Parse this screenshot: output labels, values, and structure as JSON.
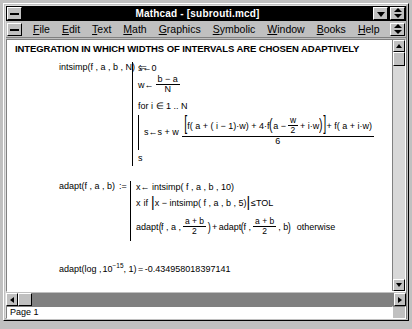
{
  "window": {
    "title": "Mathcad - [subrouti.mcd]",
    "system_menu_icon": "window-menu-icon",
    "minimize_icon": "minimize-icon",
    "restore_icon": "restore-icon",
    "doc_system_menu_icon": "document-menu-icon",
    "doc_restore_icon": "document-restore-icon"
  },
  "menubar": {
    "items": [
      {
        "label": "File",
        "accel": "F"
      },
      {
        "label": "Edit",
        "accel": "E"
      },
      {
        "label": "Text",
        "accel": "T"
      },
      {
        "label": "Math",
        "accel": "M"
      },
      {
        "label": "Graphics",
        "accel": "G"
      },
      {
        "label": "Symbolic",
        "accel": "S"
      },
      {
        "label": "Window",
        "accel": "W"
      },
      {
        "label": "Books",
        "accel": "B"
      },
      {
        "label": "Help",
        "accel": "H"
      }
    ]
  },
  "document": {
    "heading": "INTEGRATION IN WHICH WIDTHS OF INTERVALS ARE CHOSEN ADAPTIVELY",
    "intsimp": {
      "name": "intsimp",
      "args": "f , a , b , N",
      "define_op": ":=",
      "line_init_s": "s←0",
      "line_w_lhs": "w←",
      "w_numerator": "b − a",
      "w_denominator": "N",
      "line_for": "for  i ∈ 1 .. N",
      "sum_lhs": "s←s + w",
      "sum_num_part1": "f( a + ( i − 1)·w) + 4·f",
      "sum_inner_lhs": "a −",
      "sum_inner_frac_num": "w",
      "sum_inner_frac_den": "2",
      "sum_inner_rhs": "+ i·w",
      "sum_num_part2": "+ f( a + i·w)",
      "sum_denominator": "6",
      "line_return": "s"
    },
    "adapt": {
      "name": "adapt",
      "args": "f , a , b",
      "define_op": ":=",
      "line_x_assign": "x← intsimp( f , a , b , 10)",
      "cond_value": "x",
      "cond_if": "if",
      "cond_expr": "x − intsimp( f , a , b , 5)",
      "cond_compare": "≤TOL",
      "rec_name1": "adapt",
      "rec_args1_lhs": "f , a ,",
      "rec_frac_num": "a + b",
      "rec_frac_den": "2",
      "rec_plus": "+",
      "rec_name2": "adapt",
      "rec_args2_lhs": "f ,",
      "rec_args2_rhs": ", b",
      "rec_otherwise": "otherwise"
    },
    "result": {
      "call_name": "adapt",
      "call_arg1": "log ,",
      "call_arg2_base": "10",
      "call_arg2_exp": "−15",
      "call_arg3": ", 1",
      "equals": "=",
      "value": "-0.434958018397141"
    }
  },
  "statusbar": {
    "message": "",
    "auto_label": "auto",
    "page_label": "Page 1",
    "extra1": "",
    "extra2": ""
  },
  "scrollbars": {
    "up_arrow_icon": "scroll-up-arrow-icon",
    "down_arrow_icon": "scroll-down-arrow-icon",
    "left_arrow_icon": "scroll-left-arrow-icon",
    "right_arrow_icon": "scroll-right-arrow-icon"
  }
}
